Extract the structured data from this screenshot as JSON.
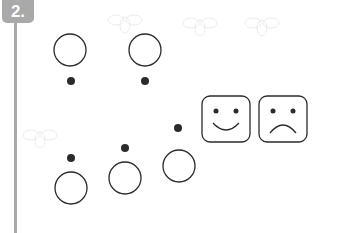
{
  "exercise": {
    "number_label": "2.",
    "badge_color": "#a9a9a9",
    "ink_color": "#2b2b2b",
    "pairs": [
      {
        "group": "top",
        "index": 1,
        "dot_position": "below-circle"
      },
      {
        "group": "top",
        "index": 2,
        "dot_position": "below-circle"
      },
      {
        "group": "bottom",
        "index": 1,
        "dot_position": "above-circle"
      },
      {
        "group": "bottom",
        "index": 2,
        "dot_position": "above-circle"
      },
      {
        "group": "bottom",
        "index": 3,
        "dot_position": "above-circle"
      }
    ],
    "answer_options": [
      {
        "name": "happy-face",
        "icon": "smiley-face-icon"
      },
      {
        "name": "sad-face",
        "icon": "sad-face-icon"
      }
    ],
    "background": "faint bee watermark pattern"
  }
}
